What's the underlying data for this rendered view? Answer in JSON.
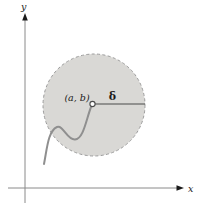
{
  "figure": {
    "labels": {
      "y_axis": "y",
      "x_axis": "x",
      "point": "(a, b)",
      "radius": "δ"
    },
    "colors": {
      "background": "#ffffff",
      "disk_fill": "#d9d8d5",
      "disk_border": "#9b9b9b",
      "curve": "#8f8f8f",
      "axis": "#8a8a8a",
      "line": "#4a4a4a",
      "label": "#1a1a1a"
    }
  }
}
